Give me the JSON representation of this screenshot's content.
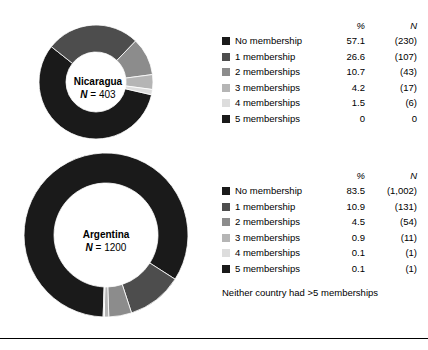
{
  "chart_data": {
    "type": "pie",
    "title": "",
    "charts": [
      {
        "name": "Nicaragua",
        "country": "Nicaragua",
        "n_label": "N = 403",
        "n_value": 403,
        "categories": [
          "No membership",
          "1 membership",
          "2 memberships",
          "3 memberships",
          "4 memberships",
          "5 memberships"
        ],
        "percent": [
          57.1,
          26.6,
          10.7,
          4.2,
          1.5,
          0
        ],
        "counts": [
          "(230)",
          "(107)",
          "(43)",
          "(17)",
          "(6)",
          "0"
        ],
        "colors": [
          "#1a1a1a",
          "#4d4d4d",
          "#8c8c8c",
          "#b5b5b5",
          "#dddddd",
          "#1a1a1a"
        ]
      },
      {
        "name": "Argentina",
        "country": "Argentina",
        "n_label": "N = 1200",
        "n_value": 1200,
        "categories": [
          "No membership",
          "1 membership",
          "2 memberships",
          "3 memberships",
          "4 memberships",
          "5 memberships"
        ],
        "percent": [
          83.5,
          10.9,
          4.5,
          0.9,
          0.1,
          0.1
        ],
        "counts": [
          "(1,002)",
          "(131)",
          "(54)",
          "(11)",
          "(1)",
          "(1)"
        ],
        "colors": [
          "#1a1a1a",
          "#4d4d4d",
          "#8c8c8c",
          "#b5b5b5",
          "#dddddd",
          "#1a1a1a"
        ]
      }
    ],
    "legend_headers": {
      "percent": "%",
      "n": "N"
    },
    "footnote": "Neither country had >5 memberships"
  }
}
